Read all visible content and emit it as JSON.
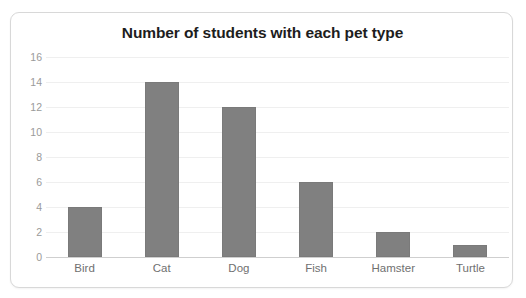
{
  "card": {
    "border_color": "#d8d8d8",
    "background": "#ffffff"
  },
  "chart_data": {
    "type": "bar",
    "title": "Number of students with each pet type",
    "xlabel": "",
    "ylabel": "",
    "categories": [
      "Bird",
      "Cat",
      "Dog",
      "Fish",
      "Hamster",
      "Turtle"
    ],
    "values": [
      4,
      14,
      12,
      6,
      2,
      1
    ],
    "ylim": [
      0,
      16
    ],
    "ytick_step": 2,
    "yticks": [
      16,
      14,
      12,
      10,
      8,
      6,
      4,
      2,
      0
    ],
    "grid": true,
    "grid_axis": "y",
    "legend": false,
    "bar_color": "#808080",
    "grid_color": "#efefef",
    "axis_color": "#cfcfcf",
    "tick_label_color": "#9a9a9a",
    "category_label_color": "#707070",
    "title_color": "#1d1d1d"
  }
}
